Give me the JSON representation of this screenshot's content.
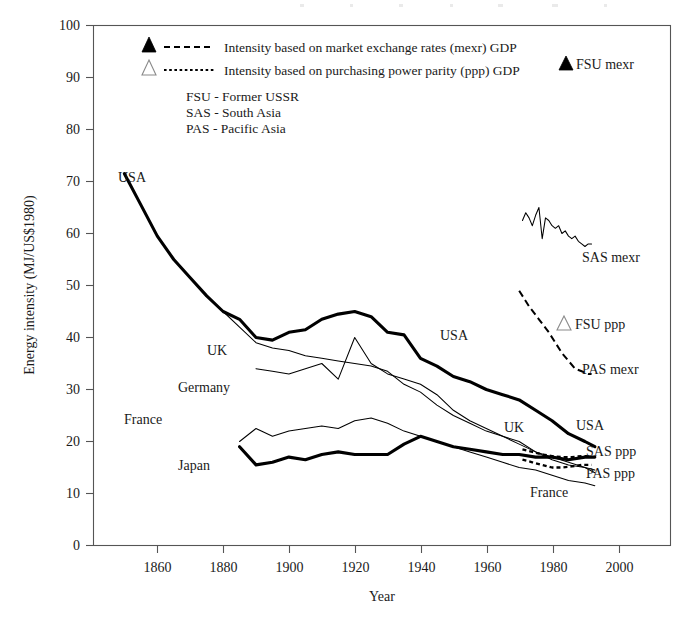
{
  "figure": {
    "background": "#ffffff",
    "ink_color": "#000000",
    "frame_color": "#555555"
  },
  "axes": {
    "x": {
      "label": "Year",
      "ticks": [
        1860,
        1880,
        1900,
        1920,
        1940,
        1960,
        1980,
        2000
      ],
      "tick_labels": [
        "1860",
        "1880",
        "1900",
        "1920",
        "1940",
        "1960",
        "1980",
        "2000"
      ],
      "min": 1840.6,
      "max": 2016
    },
    "y": {
      "label": "Energy intensity (MJ/US$1980)",
      "ticks": [
        0,
        10,
        20,
        30,
        40,
        50,
        60,
        70,
        80,
        90,
        100
      ],
      "tick_labels": [
        "0",
        "10",
        "20",
        "30",
        "40",
        "50",
        "60",
        "70",
        "80",
        "90",
        "100"
      ],
      "min": 0,
      "max": 100
    },
    "grid": false
  },
  "legend": {
    "position": "inside-top-left",
    "entries": [
      {
        "marker": "filled-triangle",
        "line_style": "dashed",
        "label": "Intensity based on market exchange rates (mexr) GDP"
      },
      {
        "marker": "hollow-triangle",
        "line_style": "dotted",
        "label": "Intensity based on purchasing power parity (ppp) GDP"
      }
    ]
  },
  "abbreviation_key": [
    "FSU - Former USSR",
    "SAS - South Asia",
    "PAS - Pacific Asia"
  ],
  "markers": [
    {
      "name": "FSU mexr",
      "marker": "filled-triangle",
      "label": "FSU mexr",
      "x_px": 570,
      "y_px": 63
    },
    {
      "name": "FSU ppp",
      "marker": "hollow-triangle",
      "label": "FSU ppp",
      "x_px": 568,
      "y_px": 323
    }
  ],
  "series_labels": [
    {
      "label": "USA",
      "x_px": 118,
      "y_px": 182
    },
    {
      "label": "UK",
      "x_px": 207,
      "y_px": 355
    },
    {
      "label": "Germany",
      "x_px": 178,
      "y_px": 392
    },
    {
      "label": "France",
      "x_px": 124,
      "y_px": 424
    },
    {
      "label": "Japan",
      "x_px": 178,
      "y_px": 470
    },
    {
      "label": "USA",
      "x_px": 440,
      "y_px": 340
    },
    {
      "label": "UK",
      "x_px": 504,
      "y_px": 432
    },
    {
      "label": "USA",
      "x_px": 576,
      "y_px": 430
    },
    {
      "label": "France",
      "x_px": 530,
      "y_px": 497
    },
    {
      "label": "SAS mexr",
      "x_px": 582,
      "y_px": 262
    },
    {
      "label": "PAS mexr",
      "x_px": 582,
      "y_px": 374
    },
    {
      "label": "SAS ppp",
      "x_px": 586,
      "y_px": 456
    },
    {
      "label": "PAS ppp",
      "x_px": 586,
      "y_px": 478
    }
  ],
  "chart_data": {
    "type": "line",
    "title": "",
    "xlabel": "Year",
    "ylabel": "Energy intensity (MJ/US$1980)",
    "xlim": [
      1840.6,
      2016
    ],
    "ylim": [
      0,
      100
    ],
    "grid": false,
    "series": [
      {
        "name": "USA mexr",
        "style": "thick-solid",
        "x": [
          1850,
          1855,
          1860,
          1865,
          1870,
          1875,
          1880,
          1885,
          1890,
          1895,
          1900,
          1905,
          1910,
          1915,
          1920,
          1925,
          1930,
          1935,
          1940,
          1945,
          1950,
          1955,
          1960,
          1965,
          1970,
          1975,
          1980,
          1985,
          1990,
          1993
        ],
        "y": [
          71.5,
          65.5,
          59.5,
          55.0,
          51.5,
          48.0,
          45.0,
          43.5,
          40.0,
          39.5,
          41.0,
          41.5,
          43.5,
          44.5,
          45.0,
          44.0,
          41.0,
          40.5,
          36.0,
          34.5,
          32.5,
          31.5,
          30.0,
          29.0,
          28.0,
          26.0,
          24.0,
          21.5,
          20.0,
          19.0
        ]
      },
      {
        "name": "UK mexr",
        "style": "thin-solid",
        "x": [
          1880,
          1885,
          1890,
          1895,
          1900,
          1905,
          1910,
          1915,
          1920,
          1925,
          1930,
          1935,
          1940,
          1945,
          1950,
          1955,
          1960,
          1965,
          1970,
          1975,
          1980,
          1985,
          1990,
          1993
        ],
        "y": [
          45.0,
          42.0,
          39.0,
          38.0,
          37.5,
          36.5,
          36.0,
          35.5,
          35.0,
          34.5,
          33.5,
          31.0,
          29.5,
          27.0,
          25.0,
          23.5,
          22.0,
          21.0,
          20.0,
          18.0,
          16.5,
          15.5,
          15.0,
          14.5
        ]
      },
      {
        "name": "Germany mexr",
        "style": "thin-solid",
        "x": [
          1890,
          1895,
          1900,
          1905,
          1910,
          1915,
          1920,
          1925,
          1930,
          1935,
          1940,
          1945,
          1950,
          1955,
          1960,
          1965,
          1970,
          1975,
          1980,
          1985,
          1990,
          1993
        ],
        "y": [
          34.0,
          33.5,
          33.0,
          34.0,
          35.0,
          32.0,
          40.0,
          35.0,
          33.0,
          32.0,
          31.0,
          29.0,
          26.0,
          24.0,
          22.5,
          21.0,
          19.5,
          18.0,
          17.0,
          16.0,
          15.0,
          14.0
        ]
      },
      {
        "name": "France mexr",
        "style": "thin-solid",
        "x": [
          1885,
          1890,
          1895,
          1900,
          1905,
          1910,
          1915,
          1920,
          1925,
          1930,
          1935,
          1940,
          1945,
          1950,
          1955,
          1960,
          1965,
          1970,
          1975,
          1980,
          1985,
          1990,
          1993
        ],
        "y": [
          20.0,
          22.5,
          21.0,
          22.0,
          22.5,
          23.0,
          22.5,
          24.0,
          24.5,
          23.5,
          22.0,
          21.0,
          20.0,
          19.0,
          18.0,
          17.0,
          16.0,
          15.0,
          14.5,
          13.5,
          12.5,
          12.0,
          11.5
        ]
      },
      {
        "name": "Japan mexr",
        "style": "thick-solid",
        "x": [
          1885,
          1890,
          1895,
          1900,
          1905,
          1910,
          1915,
          1920,
          1925,
          1930,
          1935,
          1940,
          1945,
          1950,
          1955,
          1960,
          1965,
          1970,
          1975,
          1980,
          1985,
          1990,
          1993
        ],
        "y": [
          19.0,
          15.5,
          16.0,
          17.0,
          16.5,
          17.5,
          18.0,
          17.5,
          17.5,
          17.5,
          19.5,
          21.0,
          20.0,
          19.0,
          18.5,
          18.0,
          17.5,
          17.5,
          17.0,
          17.0,
          16.5,
          17.0,
          17.0
        ]
      },
      {
        "name": "SAS mexr",
        "style": "thin-solid",
        "x": [
          1971,
          1972,
          1973,
          1974,
          1975,
          1976,
          1977,
          1978,
          1979,
          1980,
          1981,
          1982,
          1983,
          1984,
          1985,
          1986,
          1987,
          1988,
          1989,
          1990,
          1991,
          1992
        ],
        "y": [
          62.5,
          64.0,
          63.0,
          61.5,
          63.5,
          65.0,
          59.0,
          63.0,
          62.5,
          61.5,
          61.0,
          61.5,
          60.0,
          60.5,
          59.5,
          59.0,
          59.5,
          58.5,
          58.0,
          57.5,
          58.0,
          58.0
        ]
      },
      {
        "name": "PAS mexr",
        "style": "dashed",
        "x": [
          1970,
          1973,
          1976,
          1979,
          1981,
          1983,
          1985,
          1987,
          1989,
          1991,
          1992
        ],
        "y": [
          49.0,
          46.0,
          43.5,
          41.0,
          39.0,
          37.0,
          35.5,
          34.0,
          33.5,
          33.0,
          33.0
        ]
      },
      {
        "name": "SAS ppp",
        "style": "dotted",
        "x": [
          1971,
          1974,
          1977,
          1980,
          1983,
          1986,
          1989,
          1991,
          1992
        ],
        "y": [
          18.5,
          18.0,
          17.5,
          17.2,
          17.0,
          17.0,
          17.2,
          17.2,
          17.0
        ]
      },
      {
        "name": "PAS ppp",
        "style": "dotted",
        "x": [
          1971,
          1974,
          1977,
          1980,
          1983,
          1986,
          1989,
          1991,
          1992
        ],
        "y": [
          16.5,
          16.0,
          15.5,
          15.0,
          15.0,
          15.2,
          15.5,
          15.5,
          15.5
        ]
      }
    ]
  }
}
